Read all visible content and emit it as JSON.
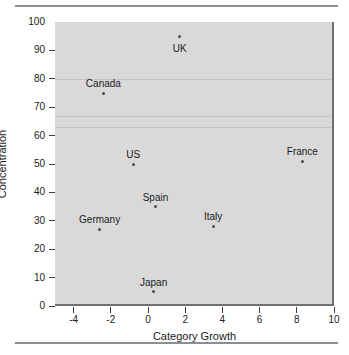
{
  "chart_data": {
    "type": "scatter",
    "title": "",
    "xlabel": "Category Growth",
    "ylabel": "Concentration",
    "xlim": [
      -5,
      10
    ],
    "ylim": [
      0,
      100
    ],
    "xticks": [
      -4,
      -2,
      0,
      2,
      4,
      6,
      8,
      10
    ],
    "xtick_labels": [
      "-4",
      "-2",
      "0",
      "2",
      "4",
      "6",
      "8",
      "10"
    ],
    "yticks": [
      0,
      10,
      20,
      30,
      40,
      50,
      60,
      70,
      80,
      90,
      100
    ],
    "ytick_labels": [
      "0",
      "10",
      "20",
      "30",
      "40",
      "50",
      "60",
      "70",
      "80",
      "90",
      "100"
    ],
    "grid": false,
    "legend": "none",
    "plot_background": "#d9d9d9",
    "marker_color": "#4c4c4c",
    "points": [
      {
        "label": "UK",
        "x": 1.7,
        "y": 95,
        "label_pos": "below"
      },
      {
        "label": "Canada",
        "x": -2.4,
        "y": 75,
        "label_pos": "above"
      },
      {
        "label": "US",
        "x": -0.8,
        "y": 50,
        "label_pos": "above"
      },
      {
        "label": "France",
        "x": 8.3,
        "y": 51,
        "label_pos": "above"
      },
      {
        "label": "Spain",
        "x": 0.4,
        "y": 35,
        "label_pos": "above"
      },
      {
        "label": "Italy",
        "x": 3.5,
        "y": 28,
        "label_pos": "above"
      },
      {
        "label": "Germany",
        "x": -2.6,
        "y": 27,
        "label_pos": "above"
      },
      {
        "label": "Japan",
        "x": 0.3,
        "y": 5,
        "label_pos": "above"
      }
    ]
  }
}
